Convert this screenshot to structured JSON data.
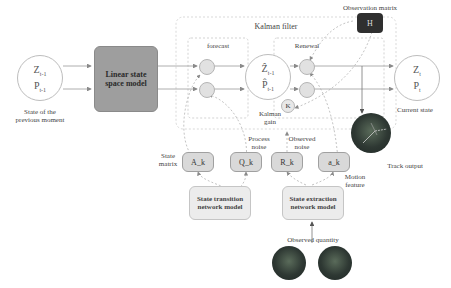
{
  "diagram": {
    "kalman_filter_title": "Kalman filter",
    "forecast_title": "forecast",
    "renewal_title": "Renewal",
    "prev_state": {
      "z": "Z",
      "z_sub": "t-1",
      "p": "P",
      "p_sub": "t-1",
      "caption_line1": "State of the",
      "caption_line2": "previous moment"
    },
    "linear_model": {
      "line1": "Linear state",
      "line2": "space model"
    },
    "predicted_state": {
      "z": "Ẑ",
      "z_sub": "t-1",
      "p": "P̂",
      "p_sub": "t-1"
    },
    "current_state": {
      "z": "Z",
      "z_sub": "t",
      "p": "P",
      "p_sub": "t",
      "caption": "Current state"
    },
    "observation_matrix": {
      "label": "Observation matrix",
      "symbol": "H"
    },
    "kalman_gain": {
      "symbol": "K",
      "line1": "Kalman",
      "line2": "gain"
    },
    "params": [
      {
        "id": "A_k",
        "label": "A_k"
      },
      {
        "id": "Q_k",
        "label": "Q_k"
      },
      {
        "id": "R_k",
        "label": "R_k"
      },
      {
        "id": "a_k",
        "label": "a_k"
      }
    ],
    "labels": {
      "state_matrix_1": "State",
      "state_matrix_2": "matrix",
      "process_noise_1": "Process",
      "process_noise_2": "noise",
      "observed_noise_1": "Observed",
      "observed_noise_2": "noise",
      "motion_feature_1": "Motion",
      "motion_feature_2": "feature",
      "track_output": "Track output",
      "observed_quantity": "Observed quantity"
    },
    "transition_model": {
      "line1": "State transition",
      "line2": "network model"
    },
    "extraction_model": {
      "line1": "State extraction",
      "line2": "network model"
    },
    "colors": {
      "linear_model_fill": "#9e9e9e",
      "param_fill": "#d9d9d9",
      "network_model_fill": "#ececec",
      "observation_matrix_fill": "#2f2f2f",
      "photo_dark": "#2e3833"
    }
  }
}
